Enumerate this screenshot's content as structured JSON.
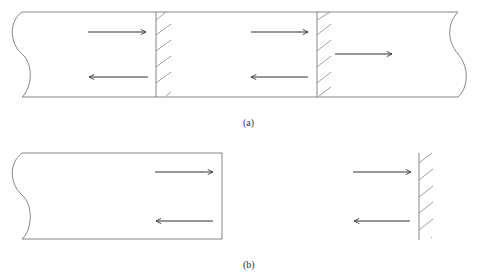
{
  "diagram": {
    "type": "wave reflection at boundaries (waveguide / string with fixed ends)",
    "panels": [
      {
        "id": "a",
        "label": "(a)",
        "description": "Long medium with two partially reflecting hatched boundaries; incident and reflected waves at each, transmitted wave beyond second boundary",
        "elements": [
          {
            "kind": "medium",
            "left_end": "wavy-cut",
            "right_end": "wavy-cut"
          },
          {
            "kind": "boundary",
            "style": "hatched",
            "position": "first"
          },
          {
            "kind": "boundary",
            "style": "hatched",
            "position": "second"
          },
          {
            "kind": "arrow",
            "direction": "right",
            "role": "incident-1"
          },
          {
            "kind": "arrow",
            "direction": "left",
            "role": "reflected-1"
          },
          {
            "kind": "arrow",
            "direction": "right",
            "role": "incident-2"
          },
          {
            "kind": "arrow",
            "direction": "left",
            "role": "reflected-2"
          },
          {
            "kind": "arrow",
            "direction": "right",
            "role": "transmitted"
          }
        ]
      },
      {
        "id": "b",
        "label": "(b)",
        "description": "Equivalent: open-ended medium (left) and an isolated hatched wall (right), each with incident and reflected arrows",
        "elements": [
          {
            "kind": "medium",
            "left_end": "wavy-cut",
            "right_end": "open-boxed"
          },
          {
            "kind": "arrow",
            "direction": "right",
            "role": "incident"
          },
          {
            "kind": "arrow",
            "direction": "left",
            "role": "reflected"
          },
          {
            "kind": "boundary",
            "style": "hatched",
            "position": "isolated wall"
          },
          {
            "kind": "arrow",
            "direction": "right",
            "role": "incident-wall"
          },
          {
            "kind": "arrow",
            "direction": "left",
            "role": "reflected-wall"
          }
        ]
      }
    ],
    "colors": {
      "line": "#555555",
      "arrow": "#333333",
      "hatch": "#888888"
    }
  }
}
